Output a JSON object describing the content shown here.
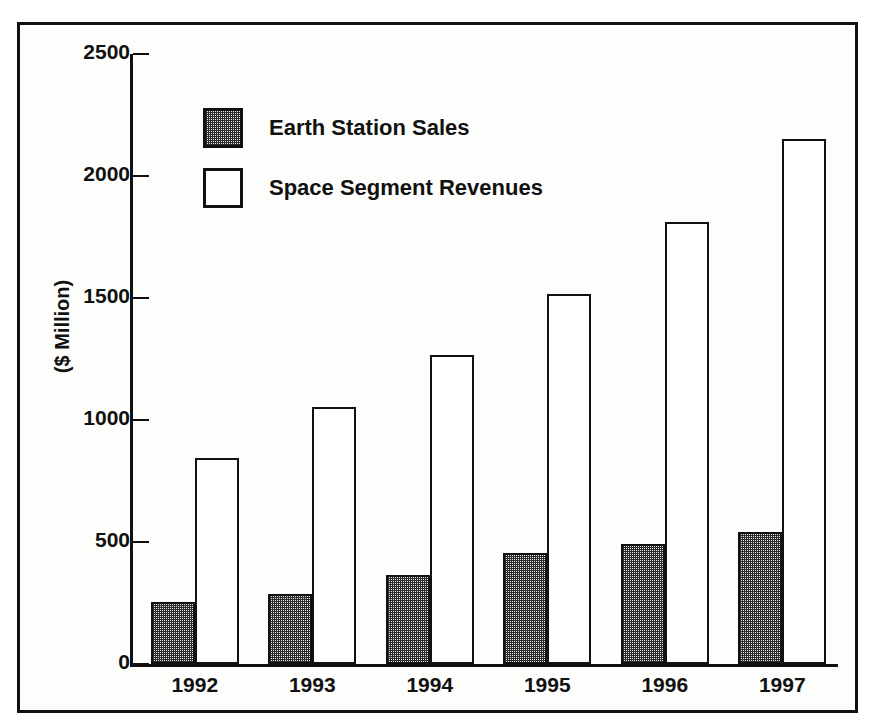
{
  "chart_data": {
    "type": "bar",
    "title": "",
    "xlabel": "",
    "ylabel": "($ Million)",
    "categories": [
      "1992",
      "1993",
      "1994",
      "1995",
      "1996",
      "1997"
    ],
    "series": [
      {
        "name": "Earth Station Sales",
        "style": "checkered-fill",
        "values": [
          255,
          285,
          365,
          455,
          490,
          540
        ]
      },
      {
        "name": "Space Segment Revenues",
        "style": "open-white",
        "values": [
          845,
          1055,
          1265,
          1515,
          1810,
          2150
        ]
      }
    ],
    "ylim": [
      0,
      2500
    ],
    "yticks": [
      0,
      500,
      1000,
      1500,
      2000,
      2500
    ],
    "ytick_labels": [
      "0",
      "500",
      "1000",
      "1500",
      "2000",
      "2500"
    ],
    "grid": false,
    "legend_position": "upper-left-inside",
    "axis_color": "#111111",
    "frame_color": "#111111",
    "background_color": "#fdfdfb"
  },
  "legend": {
    "items": [
      {
        "label": "Earth Station Sales",
        "swatch": "checkered-swatch"
      },
      {
        "label": "Space Segment Revenues",
        "swatch": "open-swatch"
      }
    ]
  }
}
